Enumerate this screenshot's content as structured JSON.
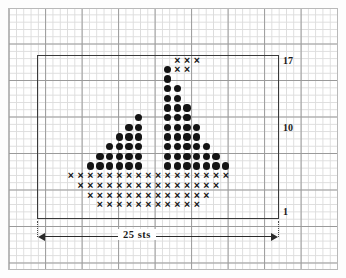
{
  "document": {
    "type": "knitting-chart",
    "title": "Sailboat motif chart"
  },
  "labels": {
    "row_top": "17",
    "row_mid": "10",
    "row_bottom": "1",
    "width_measure": "25 sts"
  },
  "symbols": {
    "dot": "●",
    "cross": "×"
  },
  "colors": {
    "symbol": "#141414",
    "frame": "#3a3a3a",
    "grid_minor": "#dcdcdc",
    "grid_major": "#9a9a9a",
    "paper": "#ffffff"
  },
  "chart_data": {
    "type": "heatmap",
    "xlabel": "25 sts",
    "ylabel": "",
    "grid": true,
    "columns": 25,
    "rows": 17,
    "row_tick_labels": [
      "1",
      "10",
      "17"
    ],
    "row_ticks": [
      1,
      10,
      17
    ],
    "col_measure_label": "25 sts",
    "legend": [
      {
        "symbol": "●",
        "name": "dot",
        "meaning": "sail / mast stitch"
      },
      {
        "symbol": "×",
        "name": "cross",
        "meaning": "hull stitch"
      }
    ],
    "cells": [
      {
        "row": 17,
        "col": 15,
        "symbol": "×"
      },
      {
        "row": 17,
        "col": 16,
        "symbol": "×"
      },
      {
        "row": 17,
        "col": 17,
        "symbol": "×"
      },
      {
        "row": 16,
        "col": 14,
        "symbol": "●"
      },
      {
        "row": 16,
        "col": 15,
        "symbol": "×"
      },
      {
        "row": 16,
        "col": 16,
        "symbol": "×"
      },
      {
        "row": 15,
        "col": 14,
        "symbol": "●"
      },
      {
        "row": 14,
        "col": 14,
        "symbol": "●"
      },
      {
        "row": 14,
        "col": 15,
        "symbol": "●"
      },
      {
        "row": 13,
        "col": 14,
        "symbol": "●"
      },
      {
        "row": 13,
        "col": 15,
        "symbol": "●"
      },
      {
        "row": 12,
        "col": 14,
        "symbol": "●"
      },
      {
        "row": 12,
        "col": 15,
        "symbol": "●"
      },
      {
        "row": 12,
        "col": 16,
        "symbol": "●"
      },
      {
        "row": 11,
        "col": 11,
        "symbol": "●"
      },
      {
        "row": 11,
        "col": 14,
        "symbol": "●"
      },
      {
        "row": 11,
        "col": 15,
        "symbol": "●"
      },
      {
        "row": 11,
        "col": 16,
        "symbol": "●"
      },
      {
        "row": 10,
        "col": 10,
        "symbol": "●"
      },
      {
        "row": 10,
        "col": 11,
        "symbol": "●"
      },
      {
        "row": 10,
        "col": 14,
        "symbol": "●"
      },
      {
        "row": 10,
        "col": 15,
        "symbol": "●"
      },
      {
        "row": 10,
        "col": 16,
        "symbol": "●"
      },
      {
        "row": 10,
        "col": 17,
        "symbol": "●"
      },
      {
        "row": 9,
        "col": 9,
        "symbol": "●"
      },
      {
        "row": 9,
        "col": 10,
        "symbol": "●"
      },
      {
        "row": 9,
        "col": 11,
        "symbol": "●"
      },
      {
        "row": 9,
        "col": 14,
        "symbol": "●"
      },
      {
        "row": 9,
        "col": 15,
        "symbol": "●"
      },
      {
        "row": 9,
        "col": 16,
        "symbol": "●"
      },
      {
        "row": 9,
        "col": 17,
        "symbol": "●"
      },
      {
        "row": 8,
        "col": 8,
        "symbol": "●"
      },
      {
        "row": 8,
        "col": 9,
        "symbol": "●"
      },
      {
        "row": 8,
        "col": 10,
        "symbol": "●"
      },
      {
        "row": 8,
        "col": 11,
        "symbol": "●"
      },
      {
        "row": 8,
        "col": 14,
        "symbol": "●"
      },
      {
        "row": 8,
        "col": 15,
        "symbol": "●"
      },
      {
        "row": 8,
        "col": 16,
        "symbol": "●"
      },
      {
        "row": 8,
        "col": 17,
        "symbol": "●"
      },
      {
        "row": 8,
        "col": 18,
        "symbol": "●"
      },
      {
        "row": 7,
        "col": 7,
        "symbol": "●"
      },
      {
        "row": 7,
        "col": 8,
        "symbol": "●"
      },
      {
        "row": 7,
        "col": 9,
        "symbol": "●"
      },
      {
        "row": 7,
        "col": 10,
        "symbol": "●"
      },
      {
        "row": 7,
        "col": 11,
        "symbol": "●"
      },
      {
        "row": 7,
        "col": 14,
        "symbol": "●"
      },
      {
        "row": 7,
        "col": 15,
        "symbol": "●"
      },
      {
        "row": 7,
        "col": 16,
        "symbol": "●"
      },
      {
        "row": 7,
        "col": 17,
        "symbol": "●"
      },
      {
        "row": 7,
        "col": 18,
        "symbol": "●"
      },
      {
        "row": 7,
        "col": 19,
        "symbol": "●"
      },
      {
        "row": 6,
        "col": 6,
        "symbol": "●"
      },
      {
        "row": 6,
        "col": 7,
        "symbol": "●"
      },
      {
        "row": 6,
        "col": 8,
        "symbol": "●"
      },
      {
        "row": 6,
        "col": 9,
        "symbol": "●"
      },
      {
        "row": 6,
        "col": 10,
        "symbol": "●"
      },
      {
        "row": 6,
        "col": 11,
        "symbol": "●"
      },
      {
        "row": 6,
        "col": 14,
        "symbol": "●"
      },
      {
        "row": 6,
        "col": 15,
        "symbol": "●"
      },
      {
        "row": 6,
        "col": 16,
        "symbol": "●"
      },
      {
        "row": 6,
        "col": 17,
        "symbol": "●"
      },
      {
        "row": 6,
        "col": 18,
        "symbol": "●"
      },
      {
        "row": 6,
        "col": 19,
        "symbol": "●"
      },
      {
        "row": 6,
        "col": 20,
        "symbol": "●"
      },
      {
        "row": 5,
        "col": 4,
        "symbol": "×"
      },
      {
        "row": 5,
        "col": 5,
        "symbol": "×"
      },
      {
        "row": 5,
        "col": 6,
        "symbol": "×"
      },
      {
        "row": 5,
        "col": 7,
        "symbol": "×"
      },
      {
        "row": 5,
        "col": 8,
        "symbol": "×"
      },
      {
        "row": 5,
        "col": 9,
        "symbol": "×"
      },
      {
        "row": 5,
        "col": 10,
        "symbol": "×"
      },
      {
        "row": 5,
        "col": 11,
        "symbol": "×"
      },
      {
        "row": 5,
        "col": 12,
        "symbol": "×"
      },
      {
        "row": 5,
        "col": 13,
        "symbol": "×"
      },
      {
        "row": 5,
        "col": 14,
        "symbol": "×"
      },
      {
        "row": 5,
        "col": 15,
        "symbol": "×"
      },
      {
        "row": 5,
        "col": 16,
        "symbol": "×"
      },
      {
        "row": 5,
        "col": 17,
        "symbol": "×"
      },
      {
        "row": 5,
        "col": 18,
        "symbol": "×"
      },
      {
        "row": 5,
        "col": 19,
        "symbol": "×"
      },
      {
        "row": 5,
        "col": 20,
        "symbol": "×"
      },
      {
        "row": 4,
        "col": 5,
        "symbol": "×"
      },
      {
        "row": 4,
        "col": 6,
        "symbol": "×"
      },
      {
        "row": 4,
        "col": 7,
        "symbol": "×"
      },
      {
        "row": 4,
        "col": 8,
        "symbol": "×"
      },
      {
        "row": 4,
        "col": 9,
        "symbol": "×"
      },
      {
        "row": 4,
        "col": 10,
        "symbol": "×"
      },
      {
        "row": 4,
        "col": 11,
        "symbol": "×"
      },
      {
        "row": 4,
        "col": 12,
        "symbol": "×"
      },
      {
        "row": 4,
        "col": 13,
        "symbol": "×"
      },
      {
        "row": 4,
        "col": 14,
        "symbol": "×"
      },
      {
        "row": 4,
        "col": 15,
        "symbol": "×"
      },
      {
        "row": 4,
        "col": 16,
        "symbol": "×"
      },
      {
        "row": 4,
        "col": 17,
        "symbol": "×"
      },
      {
        "row": 4,
        "col": 18,
        "symbol": "×"
      },
      {
        "row": 4,
        "col": 19,
        "symbol": "×"
      },
      {
        "row": 3,
        "col": 6,
        "symbol": "×"
      },
      {
        "row": 3,
        "col": 7,
        "symbol": "×"
      },
      {
        "row": 3,
        "col": 8,
        "symbol": "×"
      },
      {
        "row": 3,
        "col": 9,
        "symbol": "×"
      },
      {
        "row": 3,
        "col": 10,
        "symbol": "×"
      },
      {
        "row": 3,
        "col": 11,
        "symbol": "×"
      },
      {
        "row": 3,
        "col": 12,
        "symbol": "×"
      },
      {
        "row": 3,
        "col": 13,
        "symbol": "×"
      },
      {
        "row": 3,
        "col": 14,
        "symbol": "×"
      },
      {
        "row": 3,
        "col": 15,
        "symbol": "×"
      },
      {
        "row": 3,
        "col": 16,
        "symbol": "×"
      },
      {
        "row": 3,
        "col": 17,
        "symbol": "×"
      },
      {
        "row": 3,
        "col": 18,
        "symbol": "×"
      },
      {
        "row": 2,
        "col": 7,
        "symbol": "×"
      },
      {
        "row": 2,
        "col": 8,
        "symbol": "×"
      },
      {
        "row": 2,
        "col": 9,
        "symbol": "×"
      },
      {
        "row": 2,
        "col": 10,
        "symbol": "×"
      },
      {
        "row": 2,
        "col": 11,
        "symbol": "×"
      },
      {
        "row": 2,
        "col": 12,
        "symbol": "×"
      },
      {
        "row": 2,
        "col": 13,
        "symbol": "×"
      },
      {
        "row": 2,
        "col": 14,
        "symbol": "×"
      },
      {
        "row": 2,
        "col": 15,
        "symbol": "×"
      },
      {
        "row": 2,
        "col": 16,
        "symbol": "×"
      },
      {
        "row": 2,
        "col": 17,
        "symbol": "×"
      }
    ]
  }
}
